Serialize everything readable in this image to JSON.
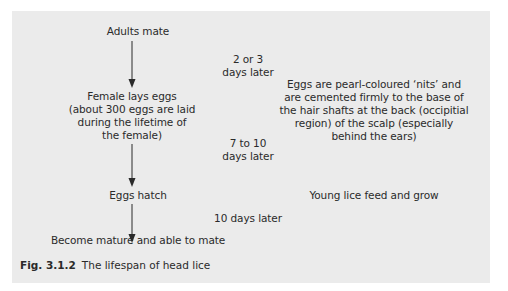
{
  "diagram": {
    "stages": [
      {
        "label": "Adults mate"
      },
      {
        "label_lines": [
          "Female lays eggs",
          "(about 300 eggs are laid",
          "during the lifetime of",
          "the female)"
        ]
      },
      {
        "label": "Eggs hatch"
      },
      {
        "label": "Become mature and able to mate"
      }
    ],
    "delays": [
      {
        "lines": [
          "2 or 3",
          "days later"
        ]
      },
      {
        "lines": [
          "7 to 10",
          "days later"
        ]
      },
      {
        "lines": [
          "10 days later"
        ]
      }
    ],
    "notes": [
      {
        "lines": [
          "Eggs are pearl-coloured ‘nits’ and",
          "are cemented firmly to the base of",
          "the hair shafts at the back (occipitial",
          "region) of the scalp (especially",
          "behind the ears)"
        ]
      },
      {
        "lines": [
          "Young lice feed and grow"
        ]
      }
    ],
    "arrows": [
      {
        "from": "Adults mate",
        "to": "Female lays eggs",
        "icon": "down-arrow-icon"
      },
      {
        "from": "Female lays eggs",
        "to": "Eggs hatch",
        "icon": "down-arrow-icon"
      },
      {
        "from": "Eggs hatch",
        "to": "Become mature and able to mate",
        "icon": "down-arrow-icon"
      }
    ]
  },
  "caption": {
    "figure_number": "Fig. 3.1.2",
    "title": "The lifespan of head lice"
  },
  "colors": {
    "panel_background": "#ebebeb",
    "text": "#2a2a2a"
  }
}
